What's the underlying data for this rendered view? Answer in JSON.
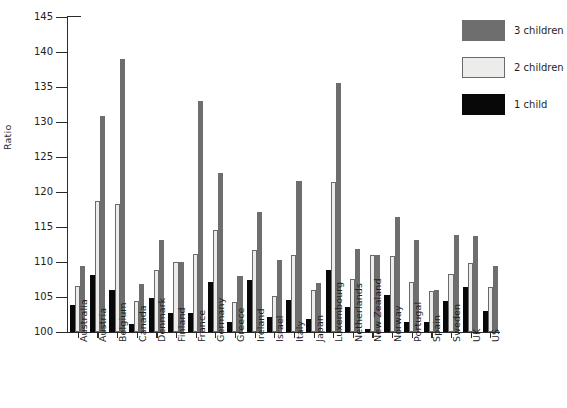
{
  "chart_data": {
    "type": "bar",
    "title": "",
    "xlabel": "",
    "ylabel": "Ratio",
    "ylim": [
      100,
      145
    ],
    "ytick_step": 5,
    "yticks": [
      100,
      105,
      110,
      115,
      120,
      125,
      130,
      135,
      140,
      145
    ],
    "grid": false,
    "legend_position": "top-right",
    "categories": [
      "Australia",
      "Austria",
      "Belgium",
      "Canada",
      "Denmark",
      "Finland",
      "France",
      "Germany",
      "Greece",
      "Ireland",
      "Israel",
      "Italy",
      "Japan",
      "Luxembourg",
      "Netherlands",
      "New Zealand",
      "Norway",
      "Portugal",
      "Spain",
      "Sweden",
      "UK",
      "US"
    ],
    "series": [
      {
        "name": "1 child",
        "color": "#080808",
        "values": [
          103.9,
          108.2,
          106.0,
          101.2,
          104.8,
          102.7,
          102.7,
          107.2,
          101.4,
          107.5,
          102.2,
          104.6,
          101.8,
          108.8,
          103.6,
          100.4,
          105.3,
          101.5,
          101.5,
          104.4,
          106.5,
          103.0
        ]
      },
      {
        "name": "2 children",
        "color": "#ececea",
        "values": [
          106.6,
          118.7,
          118.3,
          104.5,
          108.9,
          110.0,
          111.2,
          114.6,
          104.3,
          111.7,
          105.1,
          111.0,
          106.0,
          121.5,
          107.6,
          111.0,
          110.8,
          107.2,
          105.9,
          108.3,
          109.9,
          106.5
        ]
      },
      {
        "name": "3 children",
        "color": "#6e6e6e",
        "values": [
          109.5,
          130.8,
          139.0,
          106.8,
          113.2,
          110.0,
          133.0,
          122.7,
          108.0,
          117.1,
          110.3,
          121.6,
          107.0,
          135.6,
          111.9,
          111.0,
          116.4,
          113.2,
          106.0,
          113.8,
          113.7,
          109.5
        ]
      }
    ]
  },
  "legend": {
    "items": [
      {
        "label": "3 children",
        "key": "s3"
      },
      {
        "label": "2 children",
        "key": "s2"
      },
      {
        "label": "1 child",
        "key": "s1"
      }
    ]
  }
}
